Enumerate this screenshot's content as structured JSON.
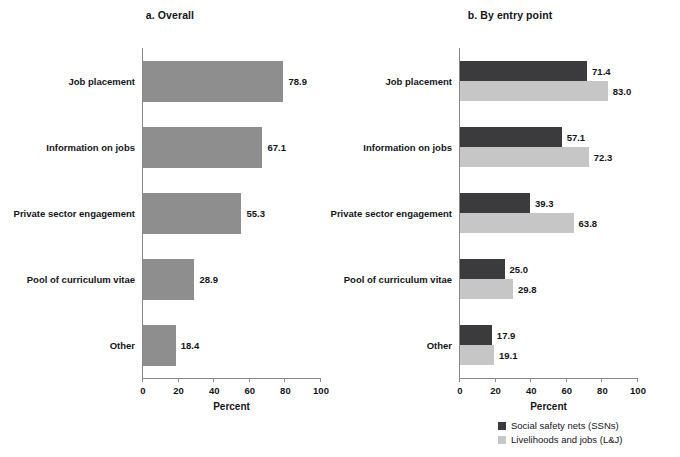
{
  "chart_data": [
    {
      "type": "bar",
      "id": "overall",
      "title": "a. Overall",
      "xlabel": "Percent",
      "ylabel": "",
      "xlim": [
        0,
        100
      ],
      "xticks": [
        0,
        20,
        40,
        60,
        80,
        100
      ],
      "grid": false,
      "legend_position": "none",
      "orientation": "horizontal",
      "categories": [
        "Job placement",
        "Information on jobs",
        "Private sector engagement",
        "Pool of curriculum vitae",
        "Other"
      ],
      "series": [
        {
          "name": "Overall",
          "color": "#8e8e8e",
          "values": [
            78.9,
            67.1,
            55.3,
            28.9,
            18.4
          ],
          "labels": [
            "78.9",
            "67.1",
            "55.3",
            "28.9",
            "18.4"
          ]
        }
      ]
    },
    {
      "type": "bar",
      "id": "by-entry-point",
      "title": "b. By entry point",
      "xlabel": "Percent",
      "ylabel": "",
      "xlim": [
        0,
        100
      ],
      "xticks": [
        0,
        20,
        40,
        60,
        80,
        100
      ],
      "grid": false,
      "legend_position": "bottom-right",
      "orientation": "horizontal",
      "categories": [
        "Job placement",
        "Information on jobs",
        "Private sector engagement",
        "Pool of curriculum vitae",
        "Other"
      ],
      "series": [
        {
          "name": "Social safety nets (SSNs)",
          "color": "#3b3b3d",
          "values": [
            71.4,
            57.1,
            39.3,
            25.0,
            17.9
          ],
          "labels": [
            "71.4",
            "57.1",
            "39.3",
            "25.0",
            "17.9"
          ]
        },
        {
          "name": "Livelihoods and jobs (L&J)",
          "color": "#c6c6c6",
          "values": [
            83.0,
            72.3,
            63.8,
            29.8,
            19.1
          ],
          "labels": [
            "83.0",
            "72.3",
            "63.8",
            "29.8",
            "19.1"
          ]
        }
      ]
    }
  ],
  "legend": {
    "items": [
      {
        "label": "Social safety nets (SSNs)",
        "color": "#3b3b3d"
      },
      {
        "label": "Livelihoods and jobs (L&J)",
        "color": "#c6c6c6"
      }
    ]
  },
  "colors": {
    "bar_overall": "#8e8e8e",
    "bar_ssn": "#3b3b3d",
    "bar_lj": "#c6c6c6",
    "axis": "#8a8a8a",
    "text": "#14151a",
    "background": "#ffffff"
  }
}
